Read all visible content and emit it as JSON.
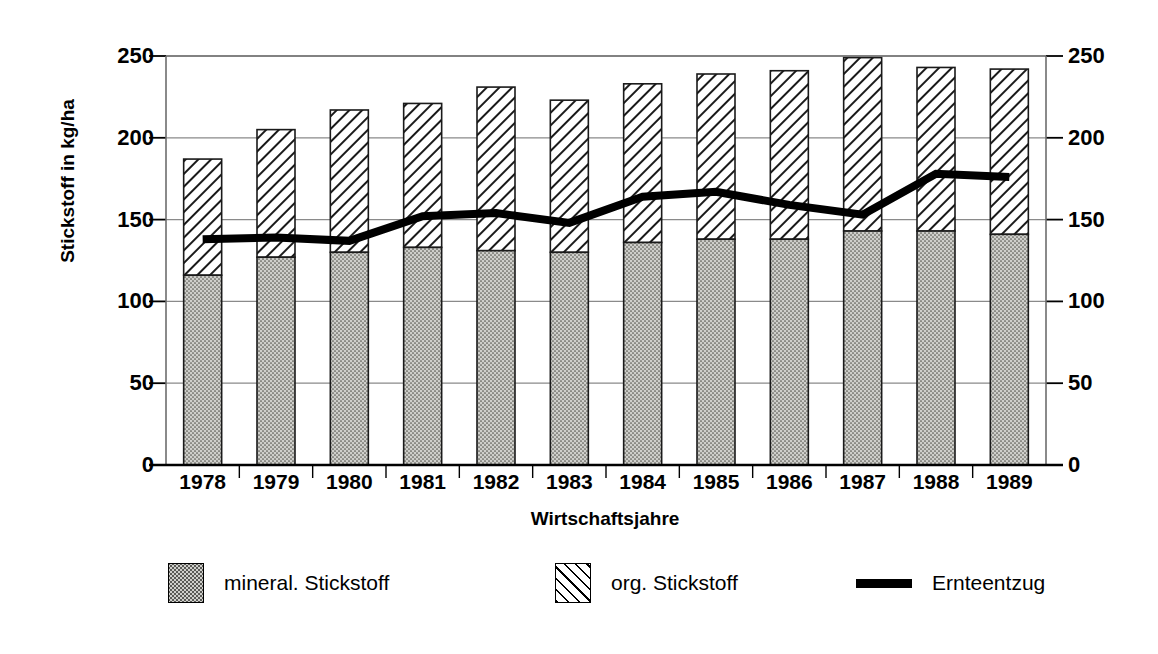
{
  "chart_data": {
    "type": "bar",
    "title": "",
    "xlabel": "Wirtschaftsjahre",
    "ylabel": "Stickstoff in kg/ha",
    "ylabel_right": "Stickstoff in kg/ha",
    "ylim": [
      0,
      250
    ],
    "yticks": [
      0,
      50,
      100,
      150,
      200,
      250
    ],
    "yticks_right": [
      0,
      50,
      100,
      150,
      200,
      250
    ],
    "grid": true,
    "stacked": true,
    "legend_position": "bottom",
    "categories": [
      "1978",
      "1979",
      "1980",
      "1981",
      "1982",
      "1983",
      "1984",
      "1985",
      "1986",
      "1987",
      "1988",
      "1989"
    ],
    "series": [
      {
        "name": "mineral. Stickstoff",
        "type": "bar",
        "fill": "dotted-gray",
        "values": [
          116,
          127,
          130,
          133,
          131,
          130,
          136,
          138,
          138,
          143,
          143,
          141
        ]
      },
      {
        "name": "org. Stickstoff",
        "type": "bar",
        "fill": "diagonal-hatch",
        "values": [
          71,
          78,
          87,
          88,
          100,
          93,
          97,
          101,
          103,
          106,
          100,
          101
        ]
      },
      {
        "name": "Ernteentzug",
        "type": "line",
        "color": "#000000",
        "values": [
          138,
          139,
          137,
          152,
          154,
          148,
          164,
          167,
          159,
          153,
          178,
          176
        ]
      }
    ],
    "totals": [
      187,
      205,
      217,
      221,
      231,
      223,
      233,
      239,
      241,
      249,
      243,
      242
    ]
  },
  "legend": {
    "items": [
      {
        "label": "mineral. Stickstoff",
        "swatch": "dotted-gray-swatch"
      },
      {
        "label": "org. Stickstoff",
        "swatch": "diagonal-hatch-swatch"
      },
      {
        "label": "Ernteentzug",
        "swatch": "black-line-swatch"
      }
    ]
  }
}
